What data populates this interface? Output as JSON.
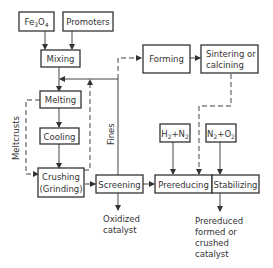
{
  "diagram": {
    "nodes": {
      "fe3o4": {
        "label": "Fe3O4"
      },
      "promoters": {
        "label": "Promoters"
      },
      "mixing": {
        "label": "Mixing"
      },
      "melting": {
        "label": "Melting"
      },
      "cooling": {
        "label": "Cooling"
      },
      "crushing": {
        "line1": "Crushing",
        "line2": "(Grinding)"
      },
      "screening": {
        "label": "Screening"
      },
      "forming": {
        "label": "Forming"
      },
      "sintering": {
        "line1": "Sintering or",
        "line2": "calcining"
      },
      "h2n2": {
        "label": "H2+N2"
      },
      "n2o2": {
        "label": "N2+O2"
      },
      "prereducing": {
        "label": "Prereducing"
      },
      "stabilizing": {
        "label": "Stabilizing"
      }
    },
    "edge_labels": {
      "meltcrusts": "Meltcrusts",
      "fines": "Fines"
    },
    "outputs": {
      "oxidized": {
        "line1": "Oxidized",
        "line2": "catalyst"
      },
      "prereduced": {
        "line1": "Prereduced",
        "line2": "formed or",
        "line3": "crushed",
        "line4": "catalyst"
      }
    }
  }
}
